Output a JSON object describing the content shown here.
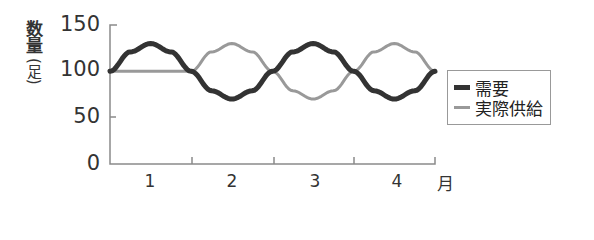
{
  "chart_data": {
    "type": "line",
    "title": "",
    "ylabel": "数量(足)",
    "ylabel_parts": {
      "main": "数量",
      "unit": "(足)"
    },
    "xlabel": "月",
    "ylim": [
      0,
      150
    ],
    "yticks": [
      "0",
      "50",
      "100",
      "150"
    ],
    "xticks": [
      "1",
      "2",
      "3",
      "4"
    ],
    "grid": false,
    "legend_position": "right",
    "x": [
      0,
      0.25,
      0.5,
      0.75,
      1.0,
      1.25,
      1.5,
      1.75,
      2.0,
      2.25,
      2.5,
      2.75,
      3.0,
      3.25,
      3.5,
      3.75,
      4.0
    ],
    "series": [
      {
        "name": "需要",
        "color": "#333333",
        "values": [
          100,
          121,
          130,
          121,
          100,
          79,
          70,
          79,
          100,
          121,
          130,
          121,
          100,
          79,
          70,
          79,
          100
        ]
      },
      {
        "name": "実際供給",
        "color": "#999999",
        "values": [
          100,
          100,
          100,
          100,
          100,
          121,
          130,
          121,
          100,
          79,
          70,
          79,
          100,
          121,
          130,
          121,
          100
        ]
      }
    ]
  },
  "legend": {
    "items": [
      {
        "label": "需要",
        "color": "#333333"
      },
      {
        "label": "実際供給",
        "color": "#999999"
      }
    ]
  }
}
